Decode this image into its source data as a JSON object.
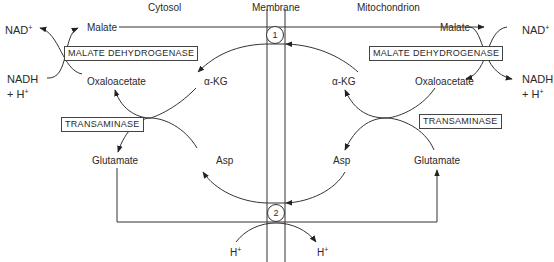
{
  "regions": {
    "cytosol": "Cytosol",
    "membrane": "Membrane",
    "mitochondrion": "Mitochondrion"
  },
  "cytosol": {
    "malate": "Malate",
    "oxaloacetate": "Oxaloacetate",
    "glutamate": "Glutamate",
    "akg": "α-KG",
    "asp": "Asp",
    "nad": "NAD",
    "nad_sup": "+",
    "nadh": "NADH",
    "h_plus_line": "+ H",
    "h_sup": "+",
    "malate_dehydrogenase": "MALATE DEHYDROGENASE",
    "transaminase": "TRANSAMINASE",
    "h_ion": "H",
    "h_ion_sup": "+"
  },
  "mitochondrion": {
    "malate": "Malate",
    "oxaloacetate": "Oxaloacetate",
    "glutamate": "Glutamate",
    "akg": "α-KG",
    "asp": "Asp",
    "nad": "NAD",
    "nad_sup": "+",
    "nadh": "NADH",
    "h_plus_line": "+ H",
    "h_sup": "+",
    "malate_dehydrogenase": "MALATE DEHYDROGENASE",
    "transaminase": "TRANSAMINASE",
    "h_ion": "H",
    "h_ion_sup": "+"
  },
  "transporters": {
    "t1": "1",
    "t2": "2"
  },
  "colors": {
    "line": "#333333",
    "text": "#2a2a2a",
    "background": "#ffffff"
  }
}
